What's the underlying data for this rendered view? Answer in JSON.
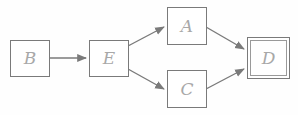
{
  "diagram": {
    "type": "flow-graph",
    "colors": {
      "stroke": "#7a7a7a",
      "label": "#a8a8a8",
      "background": "#fefefe"
    },
    "nodes": [
      {
        "id": "B",
        "label": "B",
        "final": false
      },
      {
        "id": "E",
        "label": "E",
        "final": false
      },
      {
        "id": "A",
        "label": "A",
        "final": false
      },
      {
        "id": "C",
        "label": "C",
        "final": false
      },
      {
        "id": "D",
        "label": "D",
        "final": true
      }
    ],
    "edges": [
      {
        "from": "B",
        "to": "E"
      },
      {
        "from": "E",
        "to": "A"
      },
      {
        "from": "E",
        "to": "C"
      },
      {
        "from": "A",
        "to": "D"
      },
      {
        "from": "C",
        "to": "D"
      }
    ]
  }
}
